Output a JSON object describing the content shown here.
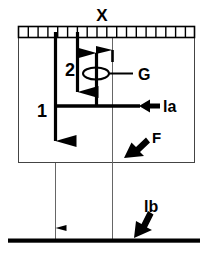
{
  "diagram": {
    "colors": {
      "stroke": "#000000",
      "thin_stroke": "#555555",
      "background": "#ffffff"
    },
    "labels": {
      "top_scale": "X",
      "load_one": "1",
      "load_two": "2",
      "pivot": "G",
      "distance_a": "la",
      "force": "F",
      "distance_b": "lb"
    },
    "elements": {
      "ruler": {
        "name": "scale-ruler",
        "cells": 18,
        "x": 18,
        "y": 26,
        "width": 177,
        "height": 11
      },
      "body_box": {
        "name": "body-outline",
        "x": 18,
        "y": 26,
        "width": 177,
        "height": 137
      },
      "ground_bar": {
        "name": "ground-line",
        "x": 8,
        "y": 240,
        "width": 192,
        "thickness": 4
      },
      "arrow_one": {
        "name": "load-arrow-1",
        "direction": "down",
        "x": 55,
        "y_start": 32,
        "y_end": 162
      },
      "arrow_two": {
        "name": "load-arrow-2",
        "direction": "down",
        "x": 77,
        "y_start": 32,
        "y_end": 106
      },
      "arrow_up_a": {
        "name": "reaction-arrow-a",
        "direction": "up",
        "x": 96,
        "y_start": 106,
        "y_end": 33
      },
      "arrow_up_b": {
        "name": "reaction-arrow-b",
        "direction": "up",
        "x": 112,
        "y_start": 60,
        "y_end": 33
      },
      "lever_bar": {
        "name": "lever-bar",
        "x1": 55,
        "x2": 140,
        "y": 106
      },
      "pivot_ellipse": {
        "name": "pivot-ellipse",
        "cx": 96,
        "cy": 73,
        "rx": 13,
        "ry": 6
      },
      "thin_line_left": {
        "name": "extension-line-left",
        "x": 55,
        "y_start": 163,
        "y_end": 240
      },
      "thin_line_center": {
        "name": "extension-line-center",
        "x": 112,
        "y_start": 37,
        "y_end": 240
      }
    }
  }
}
